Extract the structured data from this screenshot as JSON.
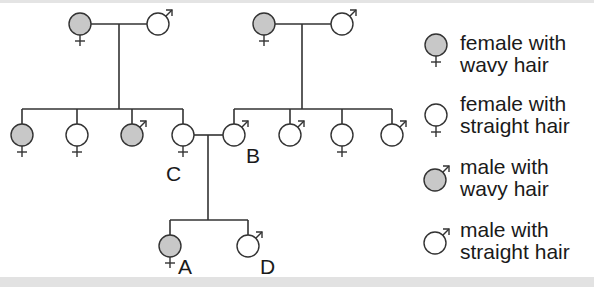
{
  "diagram": {
    "type": "pedigree",
    "colors": {
      "affected": "#c8c8c8",
      "unaffected": "#ffffff",
      "stroke": "#333333"
    },
    "individuals": [
      {
        "id": "gp1-female",
        "sex": "female",
        "trait": "wavy"
      },
      {
        "id": "gp1-male",
        "sex": "male",
        "trait": "straight"
      },
      {
        "id": "gp2-female",
        "sex": "female",
        "trait": "wavy"
      },
      {
        "id": "gp2-male",
        "sex": "male",
        "trait": "straight"
      },
      {
        "id": "c1",
        "sex": "female",
        "trait": "wavy"
      },
      {
        "id": "c2",
        "sex": "female",
        "trait": "straight"
      },
      {
        "id": "c3",
        "sex": "male",
        "trait": "wavy"
      },
      {
        "id": "C",
        "sex": "female",
        "trait": "straight",
        "label": "C"
      },
      {
        "id": "B",
        "sex": "male",
        "trait": "straight",
        "label": "B"
      },
      {
        "id": "c6",
        "sex": "male",
        "trait": "straight"
      },
      {
        "id": "c7",
        "sex": "female",
        "trait": "straight"
      },
      {
        "id": "c8",
        "sex": "male",
        "trait": "straight"
      },
      {
        "id": "A",
        "sex": "female",
        "trait": "wavy",
        "label": "A"
      },
      {
        "id": "D",
        "sex": "male",
        "trait": "straight",
        "label": "D"
      }
    ],
    "labels": {
      "A": "A",
      "B": "B",
      "C": "C",
      "D": "D"
    }
  },
  "legend": {
    "items": [
      {
        "line1": "female with",
        "line2": "wavy hair",
        "sex": "female",
        "trait": "wavy"
      },
      {
        "line1": "female with",
        "line2": "straight hair",
        "sex": "female",
        "trait": "straight"
      },
      {
        "line1": "male with",
        "line2": "wavy hair",
        "sex": "male",
        "trait": "wavy"
      },
      {
        "line1": "male with",
        "line2": "straight hair",
        "sex": "male",
        "trait": "straight"
      }
    ]
  }
}
